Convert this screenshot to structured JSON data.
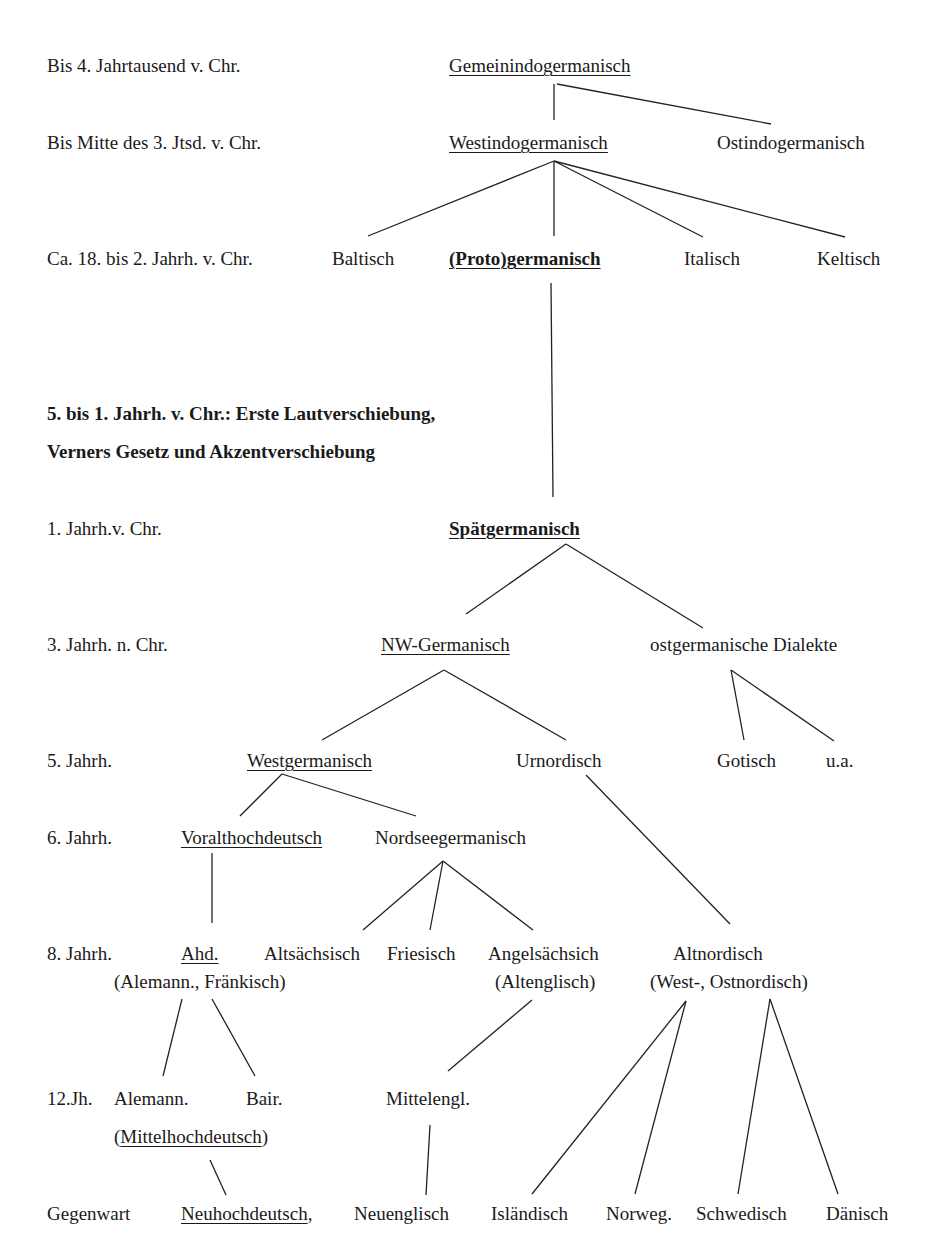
{
  "diagram": {
    "periods": [
      {
        "label": "Bis 4. Jahrtausend v. Chr."
      },
      {
        "label": "Bis Mitte des 3. Jtsd. v. Chr."
      },
      {
        "label": "Ca. 18. bis 2. Jahrh. v. Chr."
      },
      {
        "label": "1. Jahrh.v. Chr."
      },
      {
        "label": "3. Jahrh. n. Chr."
      },
      {
        "label": "5. Jahrh."
      },
      {
        "label": "6. Jahrh."
      },
      {
        "label": "8. Jahrh."
      },
      {
        "label": "12.Jh."
      },
      {
        "label": "Gegenwart"
      }
    ],
    "annotation": {
      "line1": "5. bis 1. Jahrh. v. Chr.: Erste Lautverschiebung,",
      "line2": "Verners Gesetz und Akzentverschiebung"
    },
    "nodes": {
      "gemeinindogermanisch": "Gemeinindogermanisch",
      "westindogermanisch": "Westindogermanisch",
      "ostindogermanisch": "Ostindogermanisch",
      "baltisch": "Baltisch",
      "protogermanisch": "(Proto)germanisch",
      "italisch": "Italisch",
      "keltisch": "Keltisch",
      "spaetgermanisch": "Spätgermanisch",
      "nw_germanisch": "NW-Germanisch",
      "ostgermanische_dialekte": "ostgermanische Dialekte",
      "westgermanisch": "Westgermanisch",
      "urnordisch": "Urnordisch",
      "gotisch": "Gotisch",
      "ua": "u.a.",
      "voralthochdeutsch": "Voralthochdeutsch",
      "nordseegermanisch": "Nordseegermanisch",
      "ahd": "Ahd.",
      "ahd_sub": "(Alemann., Fränkisch)",
      "altsaechsisch": "Altsächsisch",
      "friesisch": "Friesisch",
      "angelsaechsisch": "Angelsächsich",
      "angelsaechsisch_sub": "(Altenglisch)",
      "altnordisch": "Altnordisch",
      "altnordisch_sub": "(West-, Ostnordisch)",
      "alemann": "Alemann.",
      "bair": "Bair.",
      "mittelhochdeutsch_open": "(",
      "mittelhochdeutsch": "Mittelhochdeutsch",
      "mittelhochdeutsch_close": ")",
      "mittelengl": "Mittelengl.",
      "neuhochdeutsch": "Neuhochdeutsch",
      "neuhochdeutsch_comma": ",",
      "neuenglisch": "Neuenglisch",
      "islaendisch": "Isländisch",
      "norweg": "Norweg.",
      "schwedisch": "Schwedisch",
      "daenisch": "Dänisch"
    }
  }
}
